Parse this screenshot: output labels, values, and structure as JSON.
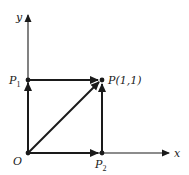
{
  "diagram": {
    "type": "vector-path-diagram",
    "axes": {
      "x_label": "x",
      "y_label": "y"
    },
    "points": {
      "origin": {
        "label": "O"
      },
      "p1": {
        "label": "P",
        "subscript": "1"
      },
      "p2": {
        "label": "P",
        "subscript": "2"
      },
      "p": {
        "label": "P(1,1)"
      }
    },
    "vectors": [
      {
        "from": "O",
        "to": "P1"
      },
      {
        "from": "P1",
        "to": "P"
      },
      {
        "from": "O",
        "to": "P"
      },
      {
        "from": "O",
        "to": "P2"
      },
      {
        "from": "P2",
        "to": "P"
      }
    ],
    "colors": {
      "ink": "#1a1a1a",
      "background": "#ffffff"
    }
  }
}
